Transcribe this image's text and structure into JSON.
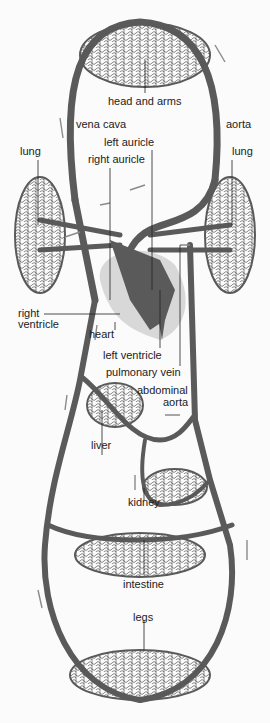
{
  "colors": {
    "vessel": "#5a5a5a",
    "heart_bg": "#d8d8d8",
    "arrow": "#8a8a8a",
    "text": "#222222",
    "background": "#fbfbfb"
  },
  "labels": {
    "head_and_arms": "head and arms",
    "vena_cava": "vena cava",
    "aorta": "aorta",
    "lung_left": "lung",
    "lung_right": "lung",
    "left_auricle": "left auricle",
    "right_auricle": "right auricle",
    "right_ventricle_1": "right",
    "right_ventricle_2": "ventricle",
    "heart": "heart",
    "left_ventricle": "left ventricle",
    "pulmonary_vein": "pulmonary vein",
    "abdominal_aorta_1": "abdominal",
    "abdominal_aorta_2": "aorta",
    "liver": "liver",
    "kidney": "kidney",
    "intestine": "intestine",
    "legs": "legs"
  }
}
